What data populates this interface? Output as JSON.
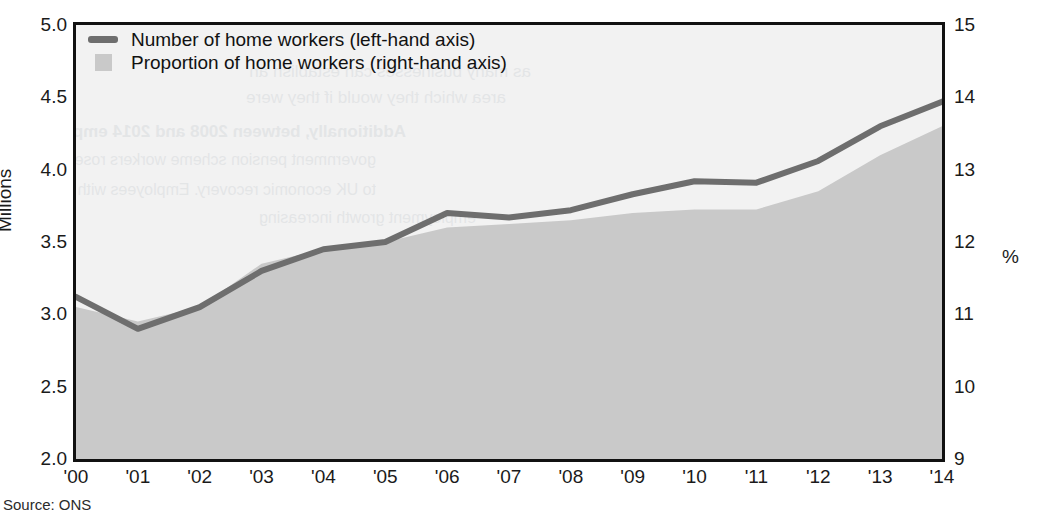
{
  "figure": {
    "title_partial": "",
    "source_note": "Source: ONS"
  },
  "legend": {
    "items": [
      {
        "label": "Number of home workers (left-hand axis)",
        "marker": "line",
        "color": "#6e6e6e"
      },
      {
        "label": "Proportion of home workers (right-hand axis)",
        "marker": "square",
        "color": "#c9c9c9"
      }
    ]
  },
  "ghost_text": {
    "note": "faint show-through from reverse of printed page",
    "lines": [
      "as many businesses can establish an",
      "area which they would if they were",
      "Additionally, between 2008 and 2014 employment",
      "government pension scheme workers rose, aligned with people",
      "to UK economic recovery. Employees with these are fewer so the local",
      "employment growth increasing",
      "Growth of self-employment"
    ]
  },
  "chart_data": {
    "type": "line",
    "title": "",
    "xlabel": "",
    "categories": [
      "'00",
      "'01",
      "'02",
      "'03",
      "'04",
      "'05",
      "'06",
      "'07",
      "'08",
      "'09",
      "'10",
      "'11",
      "'12",
      "'13",
      "'14"
    ],
    "grid": false,
    "legend_position": "top-left",
    "axes": {
      "left": {
        "label": "Millions",
        "ticks": [
          "2.0",
          "2.5",
          "3.0",
          "3.5",
          "4.0",
          "4.5",
          "5.0"
        ],
        "tick_values": [
          2.0,
          2.5,
          3.0,
          3.5,
          4.0,
          4.5,
          5.0
        ],
        "ylim": [
          2.0,
          5.0
        ]
      },
      "right": {
        "label": "%",
        "ticks": [
          "9",
          "10",
          "11",
          "12",
          "13",
          "14",
          "15"
        ],
        "tick_values": [
          9,
          10,
          11,
          12,
          13,
          14,
          15
        ],
        "ylim": [
          9,
          15
        ]
      }
    },
    "series": [
      {
        "name": "Number of home workers (left-hand axis)",
        "axis": "left",
        "type": "line",
        "unit": "Millions",
        "color": "#6e6e6e",
        "values": [
          3.12,
          2.9,
          3.05,
          3.3,
          3.45,
          3.5,
          3.7,
          3.67,
          3.72,
          3.83,
          3.92,
          3.91,
          4.06,
          4.3,
          4.47
        ]
      },
      {
        "name": "Proportion of home workers (right-hand axis)",
        "axis": "right",
        "type": "area",
        "unit": "%",
        "color": "#c9c9c9",
        "values": [
          11.1,
          10.9,
          11.1,
          11.7,
          11.9,
          12.0,
          12.2,
          12.25,
          12.3,
          12.4,
          12.45,
          12.45,
          12.7,
          13.2,
          13.6
        ]
      }
    ]
  }
}
